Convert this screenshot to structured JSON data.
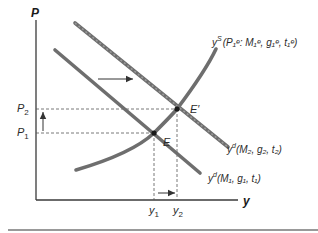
{
  "diagram": {
    "type": "aggregate supply-demand shift",
    "axes": {
      "y_label": "P",
      "x_label": "y"
    },
    "price_ticks": [
      {
        "base": "P",
        "sub": "2"
      },
      {
        "base": "P",
        "sub": "1"
      }
    ],
    "output_ticks": [
      {
        "base": "y",
        "sub": "1"
      },
      {
        "base": "y",
        "sub": "2"
      }
    ],
    "equilibria": [
      {
        "label": "E"
      },
      {
        "label": "E′"
      }
    ],
    "curves": {
      "supply": {
        "base": "y",
        "sup": "S",
        "args": "(P₁ᵉ: M₁ᵉ, g₁ᵉ, t₁ᵉ)"
      },
      "demand_2": {
        "base": "y",
        "sup": "d",
        "args": "(M₂, g₂, t₂)"
      },
      "demand_1": {
        "base": "y",
        "sup": "d",
        "args": "(M₁, g₁, t₁)"
      }
    },
    "arrows": [
      {
        "name": "demand-shift-right"
      },
      {
        "name": "price-increase"
      },
      {
        "name": "output-increase"
      }
    ],
    "colors": {
      "curve": "#6e6e6e",
      "axis": "#3a3a3a",
      "guide": "#555555",
      "rule": "#777777"
    }
  }
}
